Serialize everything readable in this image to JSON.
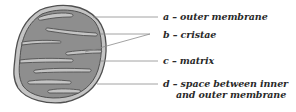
{
  "diagram": {
    "colors": {
      "outer_fill": "#c4c4c4",
      "matrix_fill": "#8e8e8e",
      "outline": "#505050",
      "leader_line": "#8a8a8a",
      "text": "#2a2a2a"
    },
    "labels": [
      {
        "id": "a",
        "text": "a – outer membrane"
      },
      {
        "id": "b",
        "text": "b – cristae"
      },
      {
        "id": "c",
        "text": "c – matrix"
      },
      {
        "id": "d",
        "text": "d – space between inner",
        "text2": "and outer membrane"
      }
    ]
  }
}
